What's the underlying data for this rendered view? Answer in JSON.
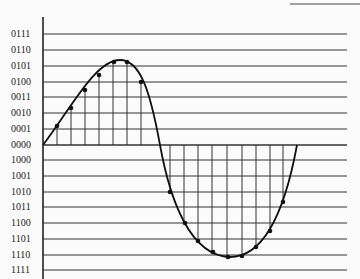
{
  "diagram": {
    "type": "sampled-sine-quantization",
    "levels": [
      {
        "code": "0111",
        "y": 34
      },
      {
        "code": "0110",
        "y": 50
      },
      {
        "code": "0101",
        "y": 66
      },
      {
        "code": "0100",
        "y": 82
      },
      {
        "code": "0011",
        "y": 97
      },
      {
        "code": "0010",
        "y": 113
      },
      {
        "code": "0001",
        "y": 129
      },
      {
        "code": "0000",
        "y": 145
      },
      {
        "code": "1000",
        "y": 160
      },
      {
        "code": "1001",
        "y": 176
      },
      {
        "code": "1010",
        "y": 192
      },
      {
        "code": "1011",
        "y": 207
      },
      {
        "code": "1100",
        "y": 223
      },
      {
        "code": "1101",
        "y": 239
      },
      {
        "code": "1110",
        "y": 255
      },
      {
        "code": "1111",
        "y": 270
      }
    ],
    "colors": {
      "line": "#222222",
      "grid": "#333333",
      "background": "#fbfbfb"
    }
  }
}
